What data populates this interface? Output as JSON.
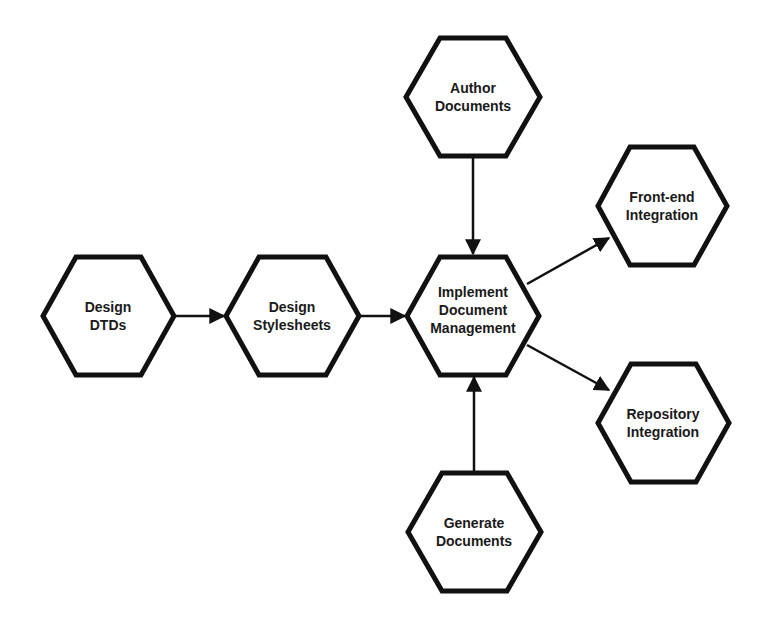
{
  "diagram": {
    "type": "flow",
    "stroke_color": "#111111",
    "fill_color": "#ffffff",
    "nodes": [
      {
        "id": "design-dtds",
        "label": "Design\nDTDs",
        "cx": 108,
        "cy": 316
      },
      {
        "id": "design-stylesheets",
        "label": "Design\nStylesheets",
        "cx": 292,
        "cy": 316
      },
      {
        "id": "implement-document-management",
        "label": "Implement\nDocument\nManagement",
        "cx": 473,
        "cy": 316
      },
      {
        "id": "author-documents",
        "label": "Author\nDocuments",
        "cx": 473,
        "cy": 97
      },
      {
        "id": "generate-documents",
        "label": "Generate\nDocuments",
        "cx": 474,
        "cy": 532
      },
      {
        "id": "front-end-integration",
        "label": "Front-end\nIntegration",
        "cx": 662,
        "cy": 206
      },
      {
        "id": "repository-integration",
        "label": "Repository\nIntegration",
        "cx": 663,
        "cy": 423
      }
    ],
    "edges": [
      {
        "from": "design-dtds",
        "to": "design-stylesheets"
      },
      {
        "from": "design-stylesheets",
        "to": "implement-document-management"
      },
      {
        "from": "author-documents",
        "to": "implement-document-management"
      },
      {
        "from": "generate-documents",
        "to": "implement-document-management"
      },
      {
        "from": "implement-document-management",
        "to": "front-end-integration"
      },
      {
        "from": "implement-document-management",
        "to": "repository-integration"
      }
    ]
  }
}
